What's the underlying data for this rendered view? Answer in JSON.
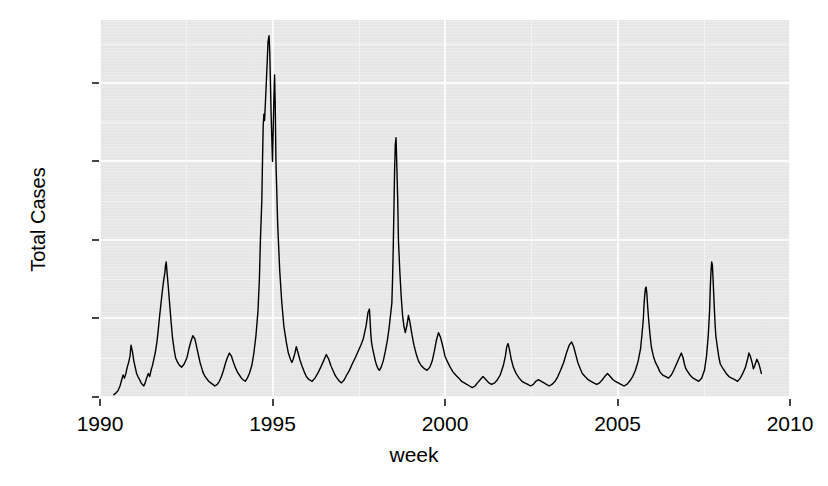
{
  "chart_data": {
    "type": "line",
    "title": "",
    "xlabel": "week",
    "ylabel": "Total Cases",
    "xlim": [
      1990.0,
      2010.0
    ],
    "ylim": [
      0,
      480
    ],
    "grid": true,
    "legend": "none",
    "line_color": "#000000",
    "panel_color": "#e9e9e9",
    "gridline_color": "#fbfbfb",
    "x_ticks": [
      1990,
      1995,
      2000,
      2005,
      2010
    ],
    "x_tick_labels": [
      "1990",
      "1995",
      "2000",
      "2005",
      "2010"
    ],
    "y_ticks": [
      0,
      100,
      200,
      300,
      400
    ],
    "y_tick_labels": [
      "0",
      "100",
      "200",
      "300",
      "400"
    ],
    "series": [
      {
        "name": "Total Cases",
        "x": [
          1990.4,
          1990.46,
          1990.52,
          1990.58,
          1990.63,
          1990.67,
          1990.71,
          1990.75,
          1990.79,
          1990.83,
          1990.87,
          1990.9,
          1990.94,
          1990.98,
          1991.02,
          1991.06,
          1991.1,
          1991.15,
          1991.19,
          1991.23,
          1991.27,
          1991.31,
          1991.35,
          1991.4,
          1991.44,
          1991.48,
          1991.52,
          1991.56,
          1991.6,
          1991.65,
          1991.69,
          1991.73,
          1991.77,
          1991.81,
          1991.85,
          1991.88,
          1991.9,
          1991.92,
          1991.94,
          1991.96,
          1991.98,
          1992.02,
          1992.06,
          1992.1,
          1992.15,
          1992.19,
          1992.25,
          1992.31,
          1992.37,
          1992.44,
          1992.52,
          1992.58,
          1992.63,
          1992.69,
          1992.75,
          1992.79,
          1992.83,
          1992.87,
          1992.9,
          1992.94,
          1992.98,
          1993.02,
          1993.08,
          1993.15,
          1993.21,
          1993.27,
          1993.33,
          1993.4,
          1993.46,
          1993.52,
          1993.58,
          1993.63,
          1993.69,
          1993.75,
          1993.81,
          1993.87,
          1993.92,
          1993.98,
          1994.04,
          1994.1,
          1994.15,
          1994.21,
          1994.27,
          1994.33,
          1994.4,
          1994.46,
          1994.52,
          1994.58,
          1994.62,
          1994.65,
          1994.69,
          1994.71,
          1994.73,
          1994.75,
          1994.77,
          1994.79,
          1994.81,
          1994.83,
          1994.85,
          1994.87,
          1994.9,
          1994.92,
          1994.94,
          1994.96,
          1994.98,
          1995.0,
          1995.02,
          1995.04,
          1995.06,
          1995.08,
          1995.1,
          1995.15,
          1995.21,
          1995.27,
          1995.33,
          1995.4,
          1995.46,
          1995.52,
          1995.56,
          1995.6,
          1995.65,
          1995.69,
          1995.73,
          1995.79,
          1995.85,
          1995.92,
          1995.98,
          1996.06,
          1996.15,
          1996.23,
          1996.31,
          1996.4,
          1996.48,
          1996.56,
          1996.63,
          1996.69,
          1996.75,
          1996.81,
          1996.87,
          1996.94,
          1997.0,
          1997.08,
          1997.15,
          1997.23,
          1997.31,
          1997.4,
          1997.48,
          1997.56,
          1997.63,
          1997.71,
          1997.77,
          1997.81,
          1997.83,
          1997.85,
          1997.87,
          1997.9,
          1997.94,
          1997.98,
          1998.02,
          1998.06,
          1998.1,
          1998.15,
          1998.21,
          1998.27,
          1998.33,
          1998.38,
          1998.42,
          1998.46,
          1998.48,
          1998.5,
          1998.52,
          1998.54,
          1998.56,
          1998.58,
          1998.6,
          1998.63,
          1998.65,
          1998.69,
          1998.73,
          1998.77,
          1998.81,
          1998.85,
          1998.9,
          1998.94,
          1998.98,
          1999.04,
          1999.1,
          1999.17,
          1999.23,
          1999.31,
          1999.4,
          1999.48,
          1999.56,
          1999.63,
          1999.69,
          1999.75,
          1999.81,
          1999.87,
          1999.94,
          2000.0,
          2000.08,
          2000.15,
          2000.23,
          2000.31,
          2000.4,
          2000.48,
          2000.56,
          2000.63,
          2000.71,
          2000.79,
          2000.87,
          2000.94,
          2001.02,
          2001.1,
          2001.19,
          2001.27,
          2001.35,
          2001.44,
          2001.52,
          2001.6,
          2001.69,
          2001.75,
          2001.79,
          2001.83,
          2001.87,
          2001.92,
          2001.98,
          2002.06,
          2002.15,
          2002.23,
          2002.31,
          2002.4,
          2002.48,
          2002.56,
          2002.63,
          2002.71,
          2002.79,
          2002.87,
          2002.94,
          2003.02,
          2003.1,
          2003.19,
          2003.27,
          2003.35,
          2003.44,
          2003.52,
          2003.6,
          2003.67,
          2003.73,
          2003.79,
          2003.85,
          2003.92,
          2003.98,
          2004.06,
          2004.15,
          2004.23,
          2004.31,
          2004.4,
          2004.48,
          2004.56,
          2004.63,
          2004.71,
          2004.79,
          2004.87,
          2004.94,
          2005.02,
          2005.1,
          2005.19,
          2005.27,
          2005.35,
          2005.44,
          2005.52,
          2005.6,
          2005.67,
          2005.71,
          2005.75,
          2005.77,
          2005.79,
          2005.81,
          2005.83,
          2005.85,
          2005.87,
          2005.9,
          2005.94,
          2005.98,
          2006.04,
          2006.1,
          2006.17,
          2006.23,
          2006.31,
          2006.4,
          2006.48,
          2006.56,
          2006.63,
          2006.71,
          2006.79,
          2006.85,
          2006.9,
          2006.94,
          2006.98,
          2007.04,
          2007.1,
          2007.19,
          2007.27,
          2007.35,
          2007.44,
          2007.52,
          2007.58,
          2007.63,
          2007.67,
          2007.69,
          2007.71,
          2007.73,
          2007.75,
          2007.77,
          2007.79,
          2007.81,
          2007.83,
          2007.85,
          2007.9,
          2007.94,
          2007.98,
          2008.06,
          2008.15,
          2008.23,
          2008.31,
          2008.4,
          2008.48,
          2008.56,
          2008.63,
          2008.71,
          2008.77,
          2008.81,
          2008.85,
          2008.9,
          2008.94,
          2008.98,
          2009.04,
          2009.1,
          2009.17
        ],
        "values": [
          3,
          5,
          8,
          14,
          22,
          28,
          24,
          30,
          38,
          44,
          52,
          66,
          58,
          46,
          38,
          30,
          26,
          22,
          18,
          16,
          14,
          18,
          24,
          30,
          26,
          34,
          40,
          48,
          56,
          70,
          86,
          104,
          120,
          136,
          150,
          158,
          168,
          172,
          160,
          150,
          140,
          118,
          96,
          76,
          60,
          50,
          44,
          40,
          38,
          42,
          50,
          62,
          70,
          78,
          74,
          66,
          58,
          50,
          44,
          38,
          32,
          28,
          24,
          20,
          18,
          16,
          14,
          16,
          20,
          26,
          34,
          42,
          50,
          56,
          52,
          44,
          38,
          32,
          28,
          24,
          22,
          20,
          24,
          30,
          40,
          56,
          78,
          110,
          150,
          200,
          250,
          300,
          345,
          360,
          352,
          370,
          390,
          410,
          430,
          452,
          460,
          440,
          400,
          360,
          330,
          300,
          340,
          380,
          410,
          370,
          300,
          220,
          160,
          120,
          90,
          70,
          56,
          48,
          44,
          48,
          56,
          64,
          58,
          48,
          40,
          32,
          26,
          22,
          20,
          24,
          30,
          38,
          46,
          54,
          48,
          40,
          34,
          28,
          24,
          20,
          18,
          22,
          28,
          34,
          42,
          50,
          58,
          66,
          74,
          90,
          108,
          112,
          96,
          80,
          70,
          62,
          54,
          46,
          40,
          36,
          34,
          38,
          46,
          58,
          72,
          88,
          104,
          120,
          150,
          190,
          240,
          290,
          322,
          330,
          300,
          250,
          200,
          160,
          128,
          104,
          90,
          82,
          92,
          104,
          96,
          80,
          66,
          54,
          46,
          40,
          36,
          34,
          38,
          46,
          58,
          72,
          82,
          76,
          64,
          52,
          44,
          38,
          32,
          28,
          24,
          20,
          18,
          16,
          14,
          12,
          14,
          18,
          22,
          26,
          22,
          18,
          16,
          18,
          22,
          28,
          40,
          52,
          64,
          68,
          60,
          48,
          38,
          30,
          24,
          20,
          18,
          16,
          14,
          16,
          20,
          22,
          20,
          18,
          16,
          14,
          16,
          20,
          26,
          34,
          44,
          56,
          66,
          70,
          64,
          54,
          44,
          36,
          30,
          26,
          22,
          20,
          18,
          16,
          18,
          22,
          26,
          30,
          26,
          22,
          20,
          18,
          16,
          14,
          16,
          20,
          26,
          34,
          46,
          62,
          80,
          100,
          118,
          130,
          138,
          140,
          132,
          118,
          100,
          80,
          64,
          52,
          44,
          38,
          32,
          28,
          26,
          24,
          28,
          34,
          42,
          50,
          56,
          50,
          42,
          36,
          32,
          28,
          24,
          22,
          20,
          24,
          34,
          52,
          78,
          110,
          140,
          160,
          172,
          168,
          150,
          130,
          110,
          92,
          78,
          62,
          50,
          42,
          36,
          30,
          26,
          24,
          22,
          20,
          24,
          30,
          38,
          48,
          56,
          52,
          44,
          36,
          40,
          48,
          42,
          30
        ]
      }
    ]
  },
  "axes": {
    "y_title": "Total Cases",
    "x_title": "week"
  }
}
